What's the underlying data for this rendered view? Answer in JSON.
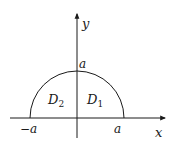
{
  "diagram": {
    "type": "semicircle-region",
    "axes": {
      "x_label": "x",
      "y_label": "y"
    },
    "ticks": {
      "neg_a": "−a",
      "pos_a": "a",
      "top_a": "a"
    },
    "regions": [
      {
        "name": "D",
        "sub": "2",
        "side": "left"
      },
      {
        "name": "D",
        "sub": "1",
        "side": "right"
      }
    ],
    "colors": {
      "stroke": "#1a1a1a",
      "background": "#ffffff"
    }
  }
}
